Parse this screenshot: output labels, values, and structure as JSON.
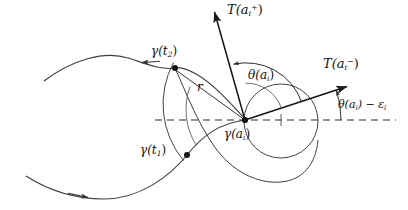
{
  "figure": {
    "kind": "mathematical-diagram",
    "width": 408,
    "height": 210,
    "background": "#ffffff",
    "stroke_color": "#1a1a1a",
    "text_color": "#111111"
  },
  "labels": {
    "tangent_plus": "T(a",
    "tangent_plus_sub": "i",
    "tangent_plus_sup": "+",
    "tangent_plus_close": ")",
    "tangent_minus": "T(a",
    "tangent_minus_sub": "i",
    "tangent_minus_sup": "−",
    "tangent_minus_close": ")",
    "theta": "θ(a",
    "theta_sub": "i",
    "theta_close": ")",
    "theta_minus_eps": "θ(a",
    "theta_minus_eps_sub": "i",
    "theta_minus_eps_mid": ") − ε",
    "theta_minus_eps_sub2": "i",
    "gamma_a": "γ(a",
    "gamma_a_sub": "i",
    "gamma_a_close": ")",
    "gamma_t1": "γ(t",
    "gamma_t1_sub": "1",
    "gamma_t1_close": ")",
    "gamma_t2": "γ(t",
    "gamma_t2_sub": "2",
    "gamma_t2_close": ")",
    "radius": "r"
  },
  "points": {
    "center": {
      "name": "gamma-a-i",
      "x": 245,
      "y": 120
    },
    "t2": {
      "name": "gamma-t2",
      "x": 175,
      "y": 68
    },
    "t1": {
      "name": "gamma-t1",
      "x": 187,
      "y": 155
    }
  },
  "geometry": {
    "radius_r": 88,
    "big_circle": {
      "cx": 281,
      "cy": 121,
      "r": 37
    },
    "axis_dashed_y": 120,
    "axis_dashed_x_start": 155,
    "axis_dashed_x_end": 396
  }
}
